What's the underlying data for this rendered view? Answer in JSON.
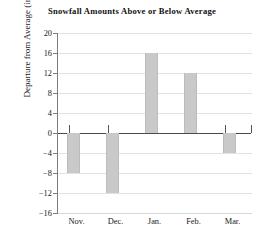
{
  "chart_data": {
    "type": "bar",
    "title": "Snowfall Amounts Above or Below Average",
    "xlabel": "",
    "ylabel": "Departure from Average (in.)",
    "categories": [
      "Nov.",
      "Dec.",
      "Jan.",
      "Feb.",
      "Mar."
    ],
    "values": [
      -8,
      -12,
      16,
      12,
      -4
    ],
    "series": [
      {
        "name": "Departure from Average (in.)",
        "values": [
          -8,
          -12,
          16,
          12,
          -4
        ]
      }
    ],
    "ylim": [
      -16,
      20
    ],
    "ytick_values": [
      20,
      16,
      12,
      8,
      4,
      0,
      -4,
      -8,
      -12,
      -16
    ],
    "ytick_labels": [
      "20",
      "16",
      "12",
      "8",
      "4",
      "0",
      "−4",
      "−8",
      "−12",
      "−16"
    ],
    "grid": true,
    "legend": false,
    "legend_position": "none",
    "bar_color": "#c9c9c9",
    "gridline_color": "#e2e2e2",
    "axis_color": "#7d7d7d",
    "zero_line_color": "#4a4a4a",
    "text_color": "#1a1a1a"
  }
}
